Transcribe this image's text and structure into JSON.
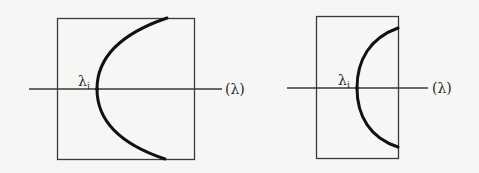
{
  "diagrams": [
    {
      "name": "left-panel",
      "vertex_label": "λ",
      "vertex_subscript": "i",
      "axis_label": "(λ)",
      "curve": "parabola opening right, vertex on axis"
    },
    {
      "name": "right-panel",
      "vertex_label": "λ",
      "vertex_subscript": "i",
      "axis_label": "(λ)",
      "curve": "semicircular arc opening right, vertex on axis"
    }
  ],
  "colors": {
    "background": "#f6f6f4",
    "ink": "#2a2a2a",
    "curve": "#111111"
  }
}
